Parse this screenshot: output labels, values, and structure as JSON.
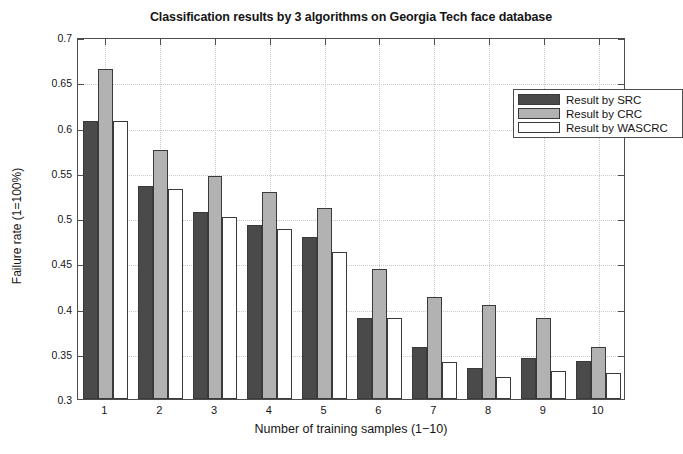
{
  "chart_data": {
    "type": "bar",
    "title": "Classification results by 3 algorithms on Georgia Tech face database",
    "xlabel": "Number of training samples (1−10)",
    "ylabel": "Failure rate (1=100%)",
    "categories": [
      "1",
      "2",
      "3",
      "4",
      "5",
      "6",
      "7",
      "8",
      "9",
      "10"
    ],
    "series": [
      {
        "name": "Result by SRC",
        "color": "#4a4a4a",
        "values": [
          0.607,
          0.535,
          0.507,
          0.492,
          0.479,
          0.39,
          0.357,
          0.334,
          0.345,
          0.342
        ]
      },
      {
        "name": "Result by CRC",
        "color": "#b2b2b2",
        "values": [
          0.665,
          0.575,
          0.546,
          0.529,
          0.511,
          0.444,
          0.413,
          0.404,
          0.389,
          0.358
        ]
      },
      {
        "name": "Result by WASCRC",
        "color": "#ffffff",
        "values": [
          0.607,
          0.532,
          0.501,
          0.488,
          0.463,
          0.39,
          0.341,
          0.324,
          0.331,
          0.329
        ]
      }
    ],
    "ylim": [
      0.3,
      0.7
    ],
    "yticks": [
      0.3,
      0.35,
      0.4,
      0.45,
      0.5,
      0.55,
      0.6,
      0.65,
      0.7
    ],
    "ytick_labels": [
      "0.3",
      "0.35",
      "0.4",
      "0.45",
      "0.5",
      "0.55",
      "0.6",
      "0.65",
      "0.7"
    ],
    "grid": true,
    "legend_position": "top-right"
  },
  "legend": {
    "entries": [
      {
        "label": "Result by SRC",
        "color": "#4a4a4a"
      },
      {
        "label": "Result by CRC",
        "color": "#b2b2b2"
      },
      {
        "label": "Result by WASCRC",
        "color": "#ffffff"
      }
    ]
  }
}
